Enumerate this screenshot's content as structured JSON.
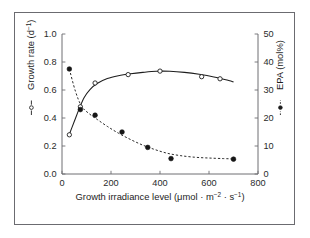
{
  "figure": {
    "background_color": "#ffffff",
    "border_color": "#6b6b70",
    "axis_color": "#6e6e73",
    "text_color": "#1d1d1d"
  },
  "chart_data": {
    "type": "scatter",
    "title": "",
    "subtitle": "",
    "xlabel_parts": {
      "main": "Growth irradiance level (μmol · m",
      "sup1": "−2",
      "mid": " · s",
      "sup2": "−1",
      "close": ")"
    },
    "xlabel": "Growth irradiance level (μmol · m−2 · s−1)",
    "ylabel_left_parts": {
      "main": "Growth rate (d",
      "sup": "−1",
      "close": ")"
    },
    "ylabel_left": "Growth rate (d−1)",
    "ylabel_right": "EPA (mol%)",
    "xlim": [
      0,
      800
    ],
    "ylim_left": [
      0.0,
      1.0
    ],
    "ylim_right": [
      0,
      50
    ],
    "xticks": [
      0,
      200,
      400,
      600,
      800
    ],
    "xtick_labels": [
      "0",
      "200",
      "400",
      "600",
      "800"
    ],
    "yticks_left": [
      0.0,
      0.2,
      0.4,
      0.6,
      0.8,
      1.0
    ],
    "ytick_labels_left": [
      "0.0",
      "0.2",
      "0.4",
      "0.6",
      "0.8",
      "1.0"
    ],
    "yticks_right": [
      0,
      10,
      20,
      30,
      40,
      50
    ],
    "ytick_labels_right": [
      "0",
      "10",
      "20",
      "30",
      "40",
      "50"
    ],
    "grid": false,
    "legend_position": "axis-labels",
    "series": [
      {
        "name": "Growth rate",
        "axis": "left",
        "marker": "open-circle",
        "line_style": "solid",
        "units": "d−1",
        "x": [
          30,
          75,
          135,
          270,
          400,
          570,
          645
        ],
        "values": [
          0.28,
          0.48,
          0.65,
          0.71,
          0.735,
          0.695,
          0.68
        ],
        "curve_x": [
          28,
          50,
          70,
          90,
          115,
          145,
          185,
          230,
          280,
          330,
          385,
          440,
          500,
          560,
          620,
          680,
          700
        ],
        "curve_values": [
          0.275,
          0.375,
          0.465,
          0.545,
          0.605,
          0.648,
          0.682,
          0.702,
          0.716,
          0.726,
          0.734,
          0.734,
          0.726,
          0.712,
          0.693,
          0.668,
          0.658
        ]
      },
      {
        "name": "EPA",
        "axis": "right",
        "marker": "filled-circle",
        "line_style": "dashed",
        "units": "mol%",
        "x": [
          30,
          75,
          135,
          245,
          350,
          445,
          700
        ],
        "values": [
          37.5,
          23.0,
          21.0,
          15.0,
          9.5,
          5.5,
          5.3
        ],
        "curve_x": [
          30,
          55,
          80,
          110,
          145,
          185,
          230,
          280,
          330,
          380,
          430,
          480,
          540,
          600,
          660,
          700
        ],
        "curve_values": [
          37.5,
          29.5,
          24.2,
          21.6,
          19.4,
          17.0,
          14.6,
          12.3,
          10.3,
          8.7,
          7.4,
          6.6,
          6.0,
          5.7,
          5.5,
          5.4
        ]
      }
    ]
  }
}
